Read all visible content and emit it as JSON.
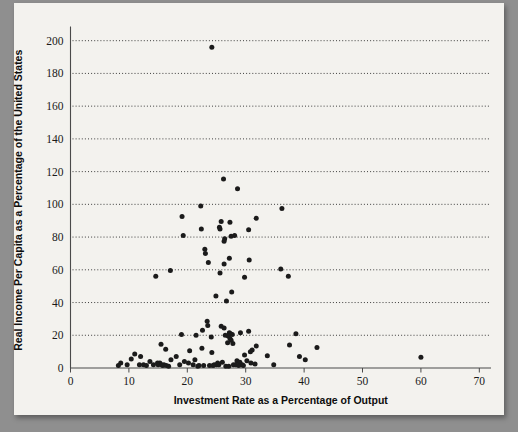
{
  "figure": {
    "background_color": "#8f8f8f",
    "page_color": "#f3f2ee",
    "marker_color": "#1b1b1b",
    "gridline_color": "#2a2a2a",
    "axis_color": "#4a4a4a"
  },
  "chart_data": {
    "type": "scatter",
    "title": "",
    "xlabel": "Investment Rate as a Percentage of Output",
    "ylabel": "Real Income Per Capita as a Percentage of the United States",
    "xlim": [
      0,
      72
    ],
    "ylim": [
      0,
      205
    ],
    "xticks": [
      0,
      10,
      20,
      30,
      40,
      50,
      60,
      70
    ],
    "xticklabels": [
      "0",
      "10",
      "20",
      "30",
      "40",
      "50",
      "60",
      "70"
    ],
    "yticks": [
      0,
      20,
      40,
      60,
      80,
      100,
      120,
      140,
      160,
      180,
      200
    ],
    "yticklabels": [
      "0",
      "20",
      "40",
      "60",
      "80",
      "100",
      "120",
      "140",
      "160",
      "180",
      "200"
    ],
    "grid": "horizontal-dotted",
    "legend": "none",
    "marker": "filled-circle",
    "points": [
      [
        24.2,
        196.0
      ],
      [
        26.2,
        115.5
      ],
      [
        28.6,
        109.5
      ],
      [
        22.3,
        99.0
      ],
      [
        36.2,
        97.5
      ],
      [
        19.1,
        92.5
      ],
      [
        31.8,
        91.5
      ],
      [
        25.8,
        89.5
      ],
      [
        27.3,
        89.0
      ],
      [
        25.5,
        86.0
      ],
      [
        25.6,
        85.0
      ],
      [
        22.4,
        85.0
      ],
      [
        30.5,
        84.5
      ],
      [
        19.3,
        81.0
      ],
      [
        28.1,
        81.0
      ],
      [
        27.5,
        80.5
      ],
      [
        26.4,
        79.0
      ],
      [
        26.3,
        77.5
      ],
      [
        23.0,
        72.5
      ],
      [
        23.1,
        70.0
      ],
      [
        27.2,
        67.0
      ],
      [
        30.6,
        66.0
      ],
      [
        23.6,
        64.5
      ],
      [
        26.3,
        63.5
      ],
      [
        17.1,
        59.5
      ],
      [
        36.0,
        60.5
      ],
      [
        25.6,
        58.0
      ],
      [
        14.6,
        56.0
      ],
      [
        29.8,
        55.5
      ],
      [
        37.3,
        56.0
      ],
      [
        27.6,
        46.5
      ],
      [
        24.9,
        44.0
      ],
      [
        26.7,
        41.0
      ],
      [
        23.4,
        28.5
      ],
      [
        23.5,
        26.0
      ],
      [
        25.8,
        25.5
      ],
      [
        26.3,
        24.5
      ],
      [
        22.6,
        23.0
      ],
      [
        30.5,
        22.5
      ],
      [
        29.1,
        21.5
      ],
      [
        27.2,
        21.5
      ],
      [
        27.4,
        21.0
      ],
      [
        27.7,
        20.5
      ],
      [
        38.6,
        21.0
      ],
      [
        19.0,
        20.5
      ],
      [
        21.5,
        20.0
      ],
      [
        26.5,
        20.0
      ],
      [
        27.0,
        19.5
      ],
      [
        24.1,
        19.0
      ],
      [
        27.3,
        18.0
      ],
      [
        27.5,
        17.0
      ],
      [
        26.9,
        15.5
      ],
      [
        27.8,
        15.0
      ],
      [
        15.5,
        14.5
      ],
      [
        31.8,
        13.5
      ],
      [
        37.5,
        14.0
      ],
      [
        42.2,
        12.5
      ],
      [
        22.5,
        12.0
      ],
      [
        16.3,
        11.5
      ],
      [
        31.1,
        11.0
      ],
      [
        20.4,
        10.5
      ],
      [
        30.8,
        10.0
      ],
      [
        24.2,
        9.5
      ],
      [
        11.0,
        8.5
      ],
      [
        29.8,
        8.0
      ],
      [
        33.7,
        7.5
      ],
      [
        18.1,
        7.0
      ],
      [
        12.0,
        7.0
      ],
      [
        39.2,
        7.0
      ],
      [
        60.0,
        6.5
      ],
      [
        10.4,
        5.5
      ],
      [
        40.2,
        5.0
      ],
      [
        17.2,
        5.0
      ],
      [
        21.3,
        5.0
      ],
      [
        28.5,
        4.5
      ],
      [
        30.2,
        4.5
      ],
      [
        13.6,
        4.0
      ],
      [
        19.5,
        4.0
      ],
      [
        26.0,
        3.5
      ],
      [
        29.0,
        3.5
      ],
      [
        8.6,
        3.0
      ],
      [
        14.9,
        3.0
      ],
      [
        15.3,
        3.0
      ],
      [
        20.2,
        3.0
      ],
      [
        25.2,
        3.0
      ],
      [
        30.9,
        3.0
      ],
      [
        31.6,
        2.5
      ],
      [
        9.7,
        2.0
      ],
      [
        11.8,
        2.0
      ],
      [
        12.5,
        2.0
      ],
      [
        14.2,
        2.0
      ],
      [
        15.0,
        2.0
      ],
      [
        15.6,
        2.0
      ],
      [
        16.0,
        2.0
      ],
      [
        18.7,
        2.0
      ],
      [
        21.0,
        2.0
      ],
      [
        24.6,
        2.0
      ],
      [
        25.0,
        2.0
      ],
      [
        25.4,
        2.0
      ],
      [
        27.9,
        2.0
      ],
      [
        28.3,
        2.0
      ],
      [
        29.4,
        2.0
      ],
      [
        34.8,
        2.0
      ],
      [
        8.2,
        1.5
      ],
      [
        13.0,
        1.5
      ],
      [
        15.8,
        1.5
      ],
      [
        16.4,
        1.5
      ],
      [
        22.0,
        1.5
      ],
      [
        22.8,
        1.5
      ],
      [
        23.8,
        1.5
      ],
      [
        24.4,
        1.5
      ],
      [
        28.8,
        1.5
      ],
      [
        29.6,
        1.5
      ],
      [
        16.8,
        1.0
      ],
      [
        21.8,
        1.0
      ],
      [
        26.6,
        1.0
      ],
      [
        27.1,
        1.0
      ]
    ]
  }
}
